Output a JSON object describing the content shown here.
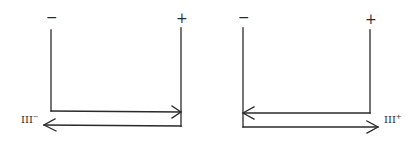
{
  "diagrams": [
    {
      "id": "left",
      "terminals": {
        "left": "−",
        "right": "+"
      },
      "label": {
        "base": "III",
        "superscript": "−"
      },
      "arrows": {
        "upper": "right",
        "lower": "left"
      }
    },
    {
      "id": "right",
      "terminals": {
        "left": "−",
        "right": "+"
      },
      "label": {
        "base": "III",
        "superscript": "+"
      },
      "arrows": {
        "upper": "left",
        "lower": "right"
      }
    }
  ],
  "colors": {
    "ink": "#2a2a2a",
    "background": "#ffffff"
  }
}
